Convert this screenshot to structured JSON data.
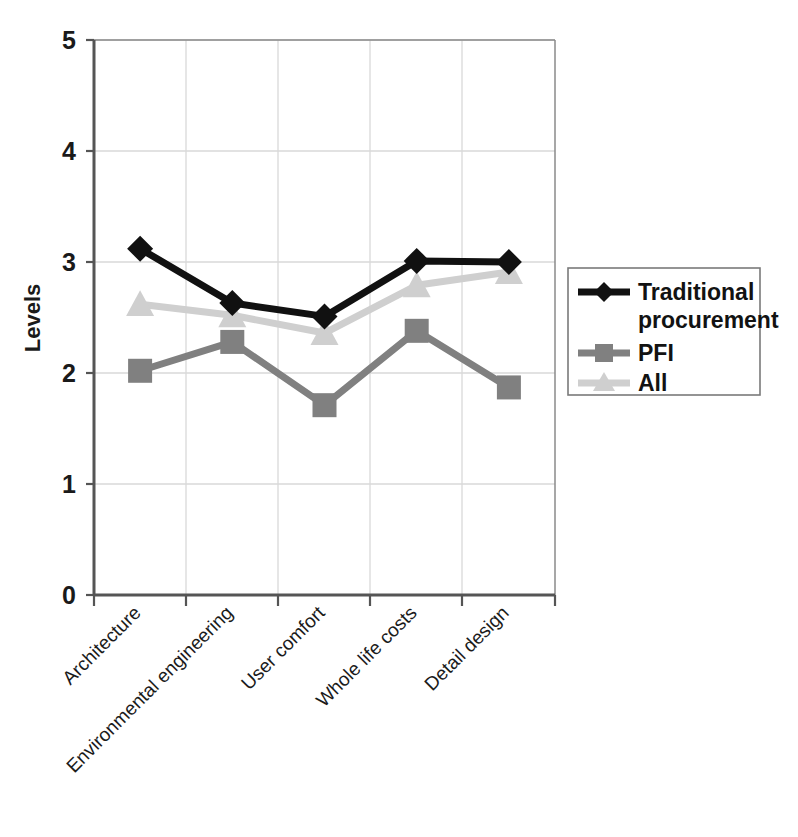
{
  "chart_data": {
    "type": "line",
    "title": "",
    "xlabel": "",
    "ylabel": "Levels",
    "ylim": [
      0,
      5
    ],
    "yticks": [
      "0",
      "1",
      "2",
      "3",
      "4",
      "5"
    ],
    "grid": true,
    "legend_position": "right",
    "categories": [
      "Architecture",
      "Environmental engineering",
      "User comfort",
      "Whole life costs",
      "Detail design"
    ],
    "series": [
      {
        "name": "Traditional procurement",
        "color": "#111111",
        "marker": "diamond",
        "values": [
          3.12,
          2.63,
          2.51,
          3.01,
          3.0
        ]
      },
      {
        "name": "PFI",
        "color": "#808080",
        "marker": "square",
        "values": [
          2.02,
          2.28,
          1.71,
          2.38,
          1.87
        ]
      },
      {
        "name": "All",
        "color": "#cfcfcf",
        "marker": "triangle",
        "values": [
          2.62,
          2.52,
          2.36,
          2.79,
          2.91
        ]
      }
    ]
  },
  "legend": {
    "entries": [
      {
        "label": "Traditional procurement"
      },
      {
        "label": "PFI"
      },
      {
        "label": "All"
      }
    ]
  },
  "axes": {
    "y_title": "Levels",
    "y_tick_0": "0",
    "y_tick_1": "1",
    "y_tick_2": "2",
    "y_tick_3": "3",
    "y_tick_4": "4",
    "y_tick_5": "5"
  },
  "xlabels": {
    "c0": "Architecture",
    "c1": "Environmental engineering",
    "c2": "User comfort",
    "c3": "Whole life costs",
    "c4": "Detail design"
  },
  "colors": {
    "traditional": "#111111",
    "pfi": "#808080",
    "all": "#cfcfcf",
    "axis": "#555555",
    "grid": "#d9d9d9",
    "text": "#1a1a1a"
  }
}
